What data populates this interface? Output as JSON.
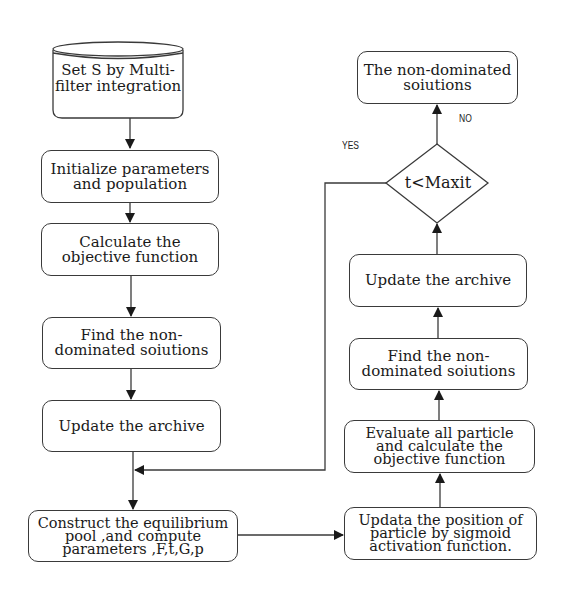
{
  "diagram": {
    "type": "flowchart",
    "left_column": {
      "start": "Set S by Multi-\nfilter integration",
      "init": "Initialize parameters\nand population",
      "calc": "Calculate the\nobjective function",
      "find": "Find the non-\ndominated soiutions",
      "update": "Update the archive",
      "construct": "Construct the equilibrium\npool ,and compute\nparameters ,F,t,G,p"
    },
    "right_column": {
      "updata_position": "Updata the position of\nparticle by sigmoid\nactivation function.",
      "evaluate": "Evaluate all particle\nand calculate the\nobjective function",
      "find": "Find the non-\ndominated soiutions",
      "update": "Update the archive",
      "decision": "t<Maxit",
      "result": "The non-dominated\nsoiutions"
    },
    "edge_labels": {
      "yes": "YES",
      "no": "NO"
    },
    "colors": {
      "stroke": "#3a3a3a",
      "background": "#ffffff",
      "text": "#1a1a1a"
    }
  }
}
